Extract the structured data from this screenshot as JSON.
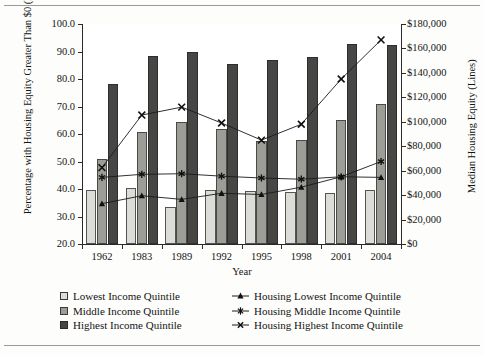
{
  "chart_data": {
    "type": "bar",
    "title": "",
    "xlabel": "Year",
    "ylabel": "Percentage with Housing Equity Greater Than $0 (Bars)",
    "ylabel_right": "Median Housing Equity (Lines)",
    "categories": [
      "1962",
      "1983",
      "1989",
      "1992",
      "1995",
      "1998",
      "2001",
      "2004"
    ],
    "ylim": [
      20.0,
      100.0
    ],
    "yticks": [
      "20.0",
      "30.0",
      "40.0",
      "50.0",
      "60.0",
      "70.0",
      "80.0",
      "90.0",
      "100.0"
    ],
    "ylim_right": [
      0,
      180000
    ],
    "yticks_right": [
      "$0",
      "$20,000",
      "$40,000",
      "$60,000",
      "$80,000",
      "$100,000",
      "$120,000",
      "$140,000",
      "$160,000",
      "$180,000"
    ],
    "grid": false,
    "legend_position": "below",
    "series": [
      {
        "name": "Lowest Income Quintile",
        "kind": "bar",
        "axis": "left",
        "color": "#dcdcd8",
        "values": [
          39.8,
          40.5,
          33.6,
          39.6,
          39.4,
          38.8,
          38.6,
          39.7
        ]
      },
      {
        "name": "Middle Income Quintile",
        "kind": "bar",
        "axis": "left",
        "color": "#9d9d98",
        "values": [
          50.8,
          60.6,
          64.2,
          61.7,
          57.5,
          57.9,
          65.0,
          70.8
        ]
      },
      {
        "name": "Highest Income Quintile",
        "kind": "bar",
        "axis": "left",
        "color": "#464644",
        "values": [
          78.2,
          88.3,
          89.8,
          85.6,
          86.8,
          88.0,
          92.6,
          92.5
        ]
      },
      {
        "name": "Housing Lowest Income Quintile",
        "kind": "line",
        "axis": "right",
        "marker": "triangle",
        "values": [
          33000,
          39500,
          36500,
          41500,
          40500,
          46500,
          55000,
          54500
        ]
      },
      {
        "name": "Housing Middle Income Quintile",
        "kind": "line",
        "axis": "right",
        "marker": "asterisk",
        "values": [
          54500,
          57000,
          57500,
          55500,
          54000,
          53000,
          55000,
          67500
        ]
      },
      {
        "name": "Housing Highest Income Quintile",
        "kind": "line",
        "axis": "right",
        "marker": "cross",
        "values": [
          62500,
          105500,
          112000,
          99000,
          85000,
          98000,
          135000,
          167000
        ]
      }
    ]
  },
  "legend": {
    "bars": [
      "Lowest Income Quintile",
      "Middle Income Quintile",
      "Highest Income Quintile"
    ],
    "lines": [
      "Housing Lowest Income Quintile",
      "Housing Middle Income Quintile",
      "Housing Highest Income Quintile"
    ]
  }
}
